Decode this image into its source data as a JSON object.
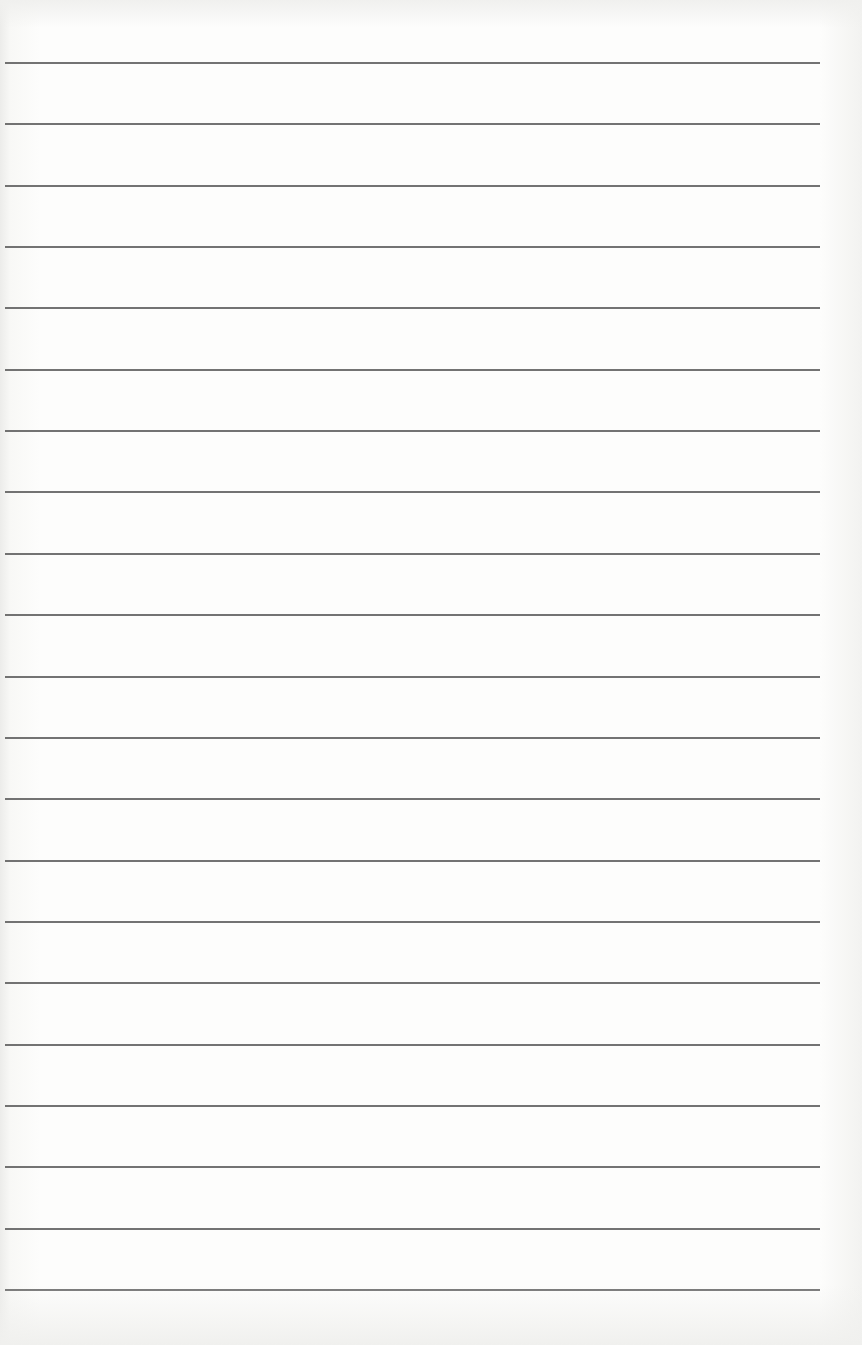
{
  "page": {
    "type": "lined paper",
    "line_count": 21,
    "first_line_y": 62,
    "line_spacing": 61.35,
    "line_left": 5,
    "line_width": 815,
    "colors": {
      "paper": "#fdfdfc",
      "rule": "#5a5a5a"
    }
  }
}
